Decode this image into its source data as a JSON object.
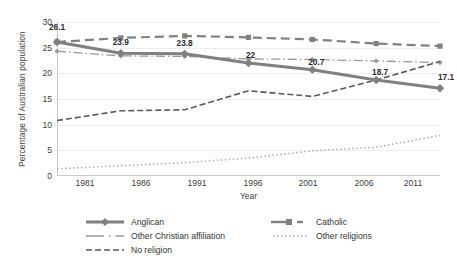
{
  "chart_data": {
    "type": "line",
    "title": "",
    "xlabel": "Year",
    "ylabel": "Percentage of Australian population",
    "categories": [
      "1981",
      "1986",
      "1991",
      "1996",
      "2001",
      "2006",
      "2011"
    ],
    "x": [
      1981,
      1986,
      1991,
      1996,
      2001,
      2006,
      2011
    ],
    "xlim": [
      1981,
      2011
    ],
    "ylim": [
      0,
      30
    ],
    "yticks": [
      0,
      5,
      10,
      15,
      20,
      25,
      30
    ],
    "grid": true,
    "legend_position": "bottom",
    "series": [
      {
        "name": "Anglican",
        "style": "solid-thick-diamond",
        "color": "#808080",
        "values": [
          26.1,
          23.9,
          23.8,
          22.0,
          20.7,
          18.7,
          17.1
        ],
        "labels": [
          "26.1",
          "23.9",
          "23.8",
          "22",
          "20.7",
          "18.7",
          "17.1"
        ]
      },
      {
        "name": "Catholic",
        "style": "dashed-square",
        "color": "#808080",
        "values": [
          26.1,
          26.9,
          27.3,
          27.0,
          26.6,
          25.8,
          25.3
        ]
      },
      {
        "name": "Other Christian affiliation",
        "style": "dash-dot",
        "color": "#9a9a9a",
        "values": [
          24.3,
          23.4,
          23.3,
          22.8,
          22.7,
          22.4,
          22.1
        ]
      },
      {
        "name": "Other religions",
        "style": "dotted",
        "color": "#a8a8a8",
        "values": [
          1.4,
          2.0,
          2.6,
          3.5,
          4.9,
          5.6,
          7.9
        ]
      },
      {
        "name": "No religion",
        "style": "dashed",
        "color": "#5a5a5a",
        "values": [
          10.8,
          12.7,
          12.9,
          16.6,
          15.5,
          18.7,
          22.3
        ]
      }
    ],
    "data_labels": [
      {
        "text": "26.1",
        "year": "1981",
        "value": 26.1
      },
      {
        "text": "23.9",
        "year": "1986",
        "value": 23.9
      },
      {
        "text": "23.8",
        "year": "1991",
        "value": 23.8
      },
      {
        "text": "22",
        "year": "1996",
        "value": 22.0
      },
      {
        "text": "20.7",
        "year": "2001",
        "value": 20.7
      },
      {
        "text": "18.7",
        "year": "2006",
        "value": 18.7
      },
      {
        "text": "17.1",
        "year": "2011",
        "value": 17.1
      }
    ]
  },
  "legend": {
    "items": [
      {
        "label": "Anglican",
        "key": "solid-thick-diamond"
      },
      {
        "label": "Other Christian affiliation",
        "key": "dash-dot"
      },
      {
        "label": "No religion",
        "key": "dashed"
      },
      {
        "label": "Catholic",
        "key": "dashed-square"
      },
      {
        "label": "Other religions",
        "key": "dotted"
      }
    ]
  },
  "axes": {
    "y_title": "Percentage of Australian population",
    "x_title": "Year",
    "y_ticks": [
      "30",
      "25",
      "20",
      "15",
      "10",
      "5",
      "0"
    ],
    "x_ticks": [
      "1981",
      "1986",
      "1991",
      "1996",
      "2001",
      "2006",
      "2011"
    ]
  },
  "colors": {
    "anglican": "#808080",
    "catholic": "#808080",
    "other_christian": "#9a9a9a",
    "other_religions": "#a8a8a8",
    "no_religion": "#5a5a5a",
    "gridline": "#eceff1",
    "axis": "#c8c8c8"
  }
}
